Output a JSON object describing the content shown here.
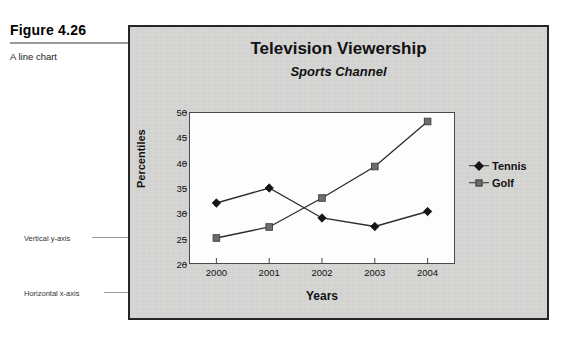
{
  "figure": {
    "label": "Figure 4.26",
    "subcaption": "A line chart"
  },
  "annotations": {
    "y_axis": "Vertical y-axis",
    "x_axis": "Horizontal x-axis"
  },
  "legend": {
    "position": "right",
    "items": [
      {
        "label": "Tennis",
        "marker": "diamond-marker",
        "color": "#151515"
      },
      {
        "label": "Golf",
        "marker": "square-marker",
        "color": "#6d6d6d"
      }
    ]
  },
  "chart_data": {
    "type": "line",
    "title": "Television Viewership",
    "subtitle": "Sports Channel",
    "xlabel": "Years",
    "ylabel": "Percentiles",
    "categories": [
      "2000",
      "2001",
      "2002",
      "2003",
      "2004"
    ],
    "ylim": [
      20,
      50
    ],
    "yticks": [
      20,
      25,
      30,
      35,
      40,
      45,
      50
    ],
    "grid": false,
    "series": [
      {
        "name": "Tennis",
        "values": [
          32,
          35,
          29,
          27.3,
          30.3
        ],
        "marker": "diamond",
        "color": "#151515"
      },
      {
        "name": "Golf",
        "values": [
          25,
          27.2,
          33,
          39.3,
          48.3
        ],
        "marker": "square",
        "color": "#6d6d6d"
      }
    ]
  }
}
